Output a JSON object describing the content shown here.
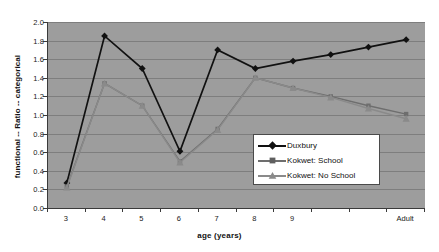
{
  "chart_data": {
    "type": "line",
    "title": "",
    "xlabel": "age (years)",
    "ylabel": "functional -- Ratio -- categorical",
    "categories": [
      "3",
      "4",
      "5",
      "6",
      "7",
      "8",
      "9",
      "",
      "",
      "Adult"
    ],
    "xtick_labels": [
      "3",
      "4",
      "5",
      "6",
      "7",
      "8",
      "9",
      "",
      "",
      "Adult"
    ],
    "ytick_labels": [
      "0.0",
      "0.2",
      "0.4",
      "0.6",
      "0.8",
      "1.0",
      "1.2",
      "1.4",
      "1.6",
      "1.8",
      "2.0"
    ],
    "ylim": [
      0.0,
      2.0
    ],
    "ystep": 0.2,
    "grid": "horizontal",
    "legend_position": "center-right-inside",
    "plot_background": "#9d9d9d",
    "series": [
      {
        "name": "Duxbury",
        "color": "#111111",
        "marker": "diamond",
        "values": [
          0.27,
          1.85,
          1.5,
          0.61,
          1.7,
          1.5,
          1.58,
          1.65,
          1.73,
          1.81
        ]
      },
      {
        "name": "Kokwet: School",
        "color": "#6e6e6e",
        "marker": "square",
        "values": [
          0.23,
          1.34,
          1.1,
          0.5,
          0.85,
          1.4,
          1.29,
          1.2,
          1.1,
          1.01
        ]
      },
      {
        "name": "Kokwet: No School",
        "color": "#8a8a8a",
        "marker": "triangle",
        "values": [
          0.22,
          1.34,
          1.1,
          0.49,
          0.84,
          1.4,
          1.29,
          1.19,
          1.07,
          0.96
        ]
      }
    ]
  },
  "legend": {
    "entries": [
      {
        "label": "Duxbury"
      },
      {
        "label": "Kokwet: School"
      },
      {
        "label": "Kokwet: No School"
      }
    ]
  }
}
